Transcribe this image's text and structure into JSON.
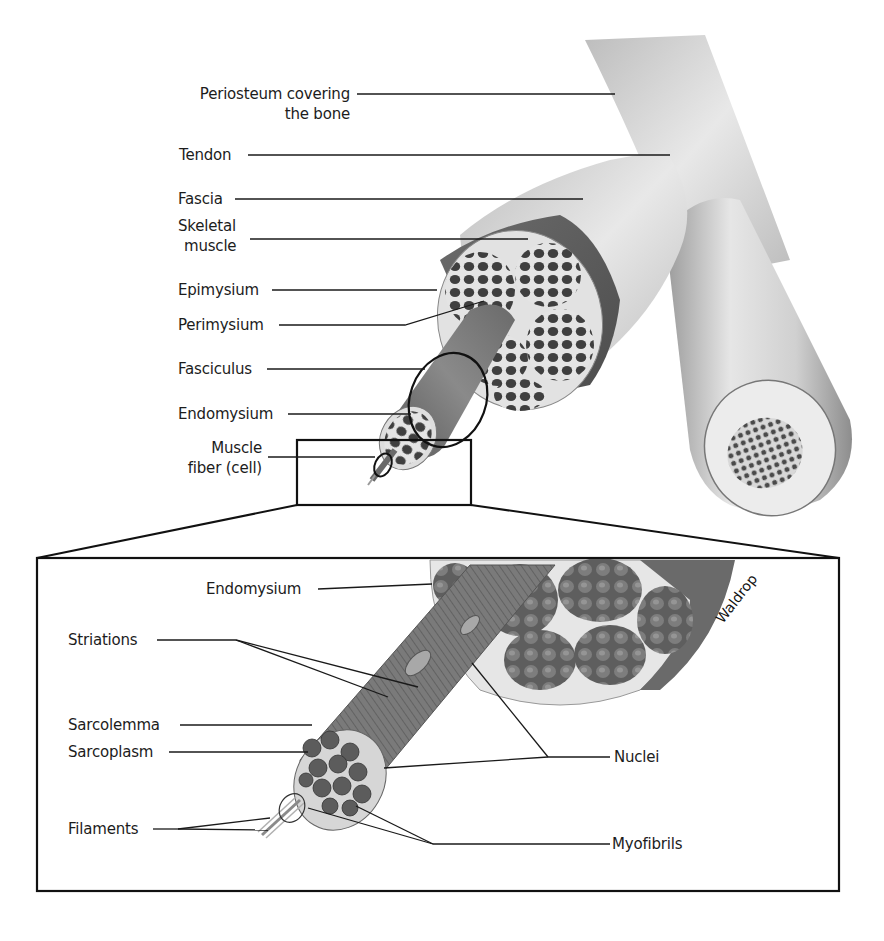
{
  "diagram": {
    "main_view": {
      "labels": [
        {
          "id": "periosteum",
          "line1": "Periosteum covering",
          "line2": "the bone"
        },
        {
          "id": "tendon",
          "text": "Tendon"
        },
        {
          "id": "fascia",
          "text": "Fascia"
        },
        {
          "id": "skeletal-muscle",
          "line1": "Skeletal",
          "line2": "muscle"
        },
        {
          "id": "epimysium",
          "text": "Epimysium"
        },
        {
          "id": "perimysium",
          "text": "Perimysium"
        },
        {
          "id": "fasciculus",
          "text": "Fasciculus"
        },
        {
          "id": "endomysium",
          "text": "Endomysium"
        },
        {
          "id": "muscle-fiber",
          "line1": "Muscle",
          "line2": "fiber (cell)"
        }
      ]
    },
    "inset_view": {
      "labels": [
        {
          "id": "endomysium",
          "text": "Endomysium"
        },
        {
          "id": "striations",
          "text": "Striations"
        },
        {
          "id": "sarcolemma",
          "text": "Sarcolemma"
        },
        {
          "id": "sarcoplasm",
          "text": "Sarcoplasm"
        },
        {
          "id": "filaments",
          "text": "Filaments"
        },
        {
          "id": "nuclei",
          "text": "Nuclei"
        },
        {
          "id": "myofibrils",
          "text": "Myofibrils"
        }
      ]
    },
    "signature": "Waldrop",
    "colors": {
      "line": "#1a1a1a",
      "muscle_dark": "#4a4a4a",
      "muscle_mid": "#7a7a7a",
      "connective": "#d8d8d8",
      "bone": "#cfcfcf"
    }
  }
}
